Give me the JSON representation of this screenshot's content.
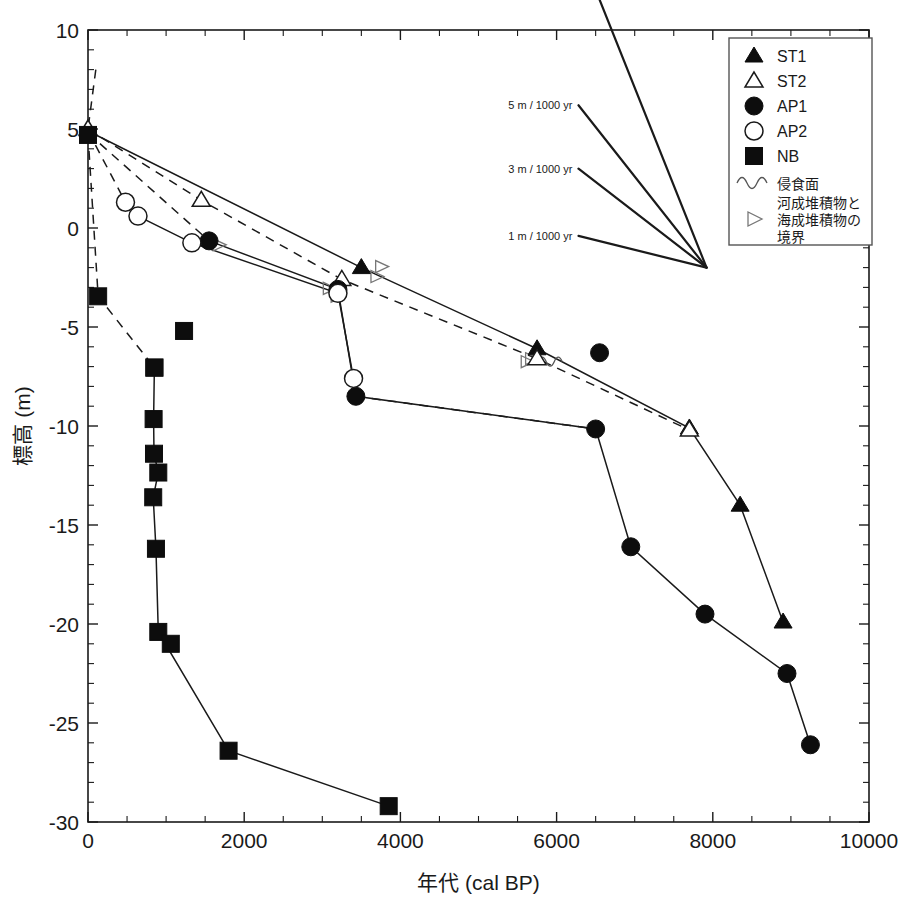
{
  "chart_data": {
    "type": "scatter",
    "title": "",
    "xlabel": "年代 (cal BP)",
    "ylabel": "標高 (m)",
    "xlim": [
      0,
      10000
    ],
    "ylim": [
      -30,
      10
    ],
    "xticks": [
      0,
      2000,
      4000,
      6000,
      8000,
      10000
    ],
    "xtick_labels": [
      "0",
      "2000",
      "4000",
      "6000",
      "8000",
      "10000"
    ],
    "x_minor_step": 500,
    "yticks": [
      10,
      5,
      0,
      -5,
      -10,
      -15,
      -20,
      -25,
      -30
    ],
    "ytick_labels": [
      "10",
      "5",
      "0",
      "-5",
      "-10",
      "-15",
      "-20",
      "-25",
      "-30"
    ],
    "y_minor_step": 1,
    "grid": false,
    "legend_position": "top-right",
    "series": [
      {
        "name": "ST1",
        "marker": "filled-triangle",
        "line": "solid",
        "points": [
          {
            "x": 0,
            "y": 4.9
          },
          {
            "x": 3500,
            "y": -2.0
          },
          {
            "x": 5750,
            "y": -6.1
          },
          {
            "x": 7700,
            "y": -10.1
          },
          {
            "x": 8350,
            "y": -14.0
          },
          {
            "x": 8900,
            "y": -19.9
          }
        ]
      },
      {
        "name": "ST2",
        "marker": "open-triangle",
        "line": "dashed",
        "points": [
          {
            "x": 0,
            "y": 5.0
          },
          {
            "x": 1450,
            "y": 1.4
          },
          {
            "x": 3250,
            "y": -2.6
          },
          {
            "x": 5750,
            "y": -6.6
          },
          {
            "x": 7700,
            "y": -10.2
          }
        ]
      },
      {
        "name": "AP1",
        "marker": "filled-circle",
        "line": "solid",
        "points": [
          {
            "x": 1550,
            "y": -0.65
          },
          {
            "x": 3200,
            "y": -3.1
          },
          {
            "x": 3430,
            "y": -8.5
          },
          {
            "x": 6500,
            "y": -10.15
          },
          {
            "x": 6950,
            "y": -16.1
          },
          {
            "x": 7900,
            "y": -19.5
          },
          {
            "x": 8950,
            "y": -22.5
          },
          {
            "x": 9250,
            "y": -26.1
          }
        ]
      },
      {
        "name": "AP1-outlier",
        "marker": "filled-circle",
        "line": "none",
        "points": [
          {
            "x": 6550,
            "y": -6.3
          }
        ]
      },
      {
        "name": "AP2",
        "marker": "open-circle",
        "line": "solid",
        "points": [
          {
            "x": 480,
            "y": 1.3
          },
          {
            "x": 640,
            "y": 0.6
          },
          {
            "x": 1330,
            "y": -0.75
          },
          {
            "x": 3200,
            "y": -3.3
          },
          {
            "x": 3400,
            "y": -7.6
          }
        ]
      },
      {
        "name": "AP2-dashed-upper",
        "marker": "none",
        "line": "dashed",
        "points": [
          {
            "x": 0,
            "y": 4.9
          },
          {
            "x": 480,
            "y": 1.3
          }
        ]
      },
      {
        "name": "AP1-dashed-upper",
        "marker": "none",
        "line": "dashed",
        "points": [
          {
            "x": 0,
            "y": 4.8
          },
          {
            "x": 1550,
            "y": -0.65
          }
        ]
      },
      {
        "name": "AP1-dashed-lower",
        "marker": "none",
        "line": "dashed",
        "points": [
          {
            "x": 3430,
            "y": -8.5
          },
          {
            "x": 6500,
            "y": -10.15
          }
        ]
      },
      {
        "name": "NB",
        "marker": "filled-square",
        "line": "solid",
        "points": [
          {
            "x": 850,
            "y": -7.05
          },
          {
            "x": 840,
            "y": -9.65
          },
          {
            "x": 845,
            "y": -11.4
          },
          {
            "x": 900,
            "y": -12.35
          },
          {
            "x": 835,
            "y": -13.6
          },
          {
            "x": 870,
            "y": -16.2
          },
          {
            "x": 900,
            "y": -20.4
          },
          {
            "x": 1800,
            "y": -26.4
          },
          {
            "x": 3850,
            "y": -29.2
          }
        ]
      },
      {
        "name": "NB-extra",
        "marker": "filled-square",
        "line": "none",
        "points": [
          {
            "x": 1230,
            "y": -5.2
          },
          {
            "x": 1060,
            "y": -21.0
          }
        ]
      },
      {
        "name": "NB-dashed",
        "marker": "filled-square",
        "line": "dashed",
        "points": [
          {
            "x": 0,
            "y": 4.7
          },
          {
            "x": 130,
            "y": -3.45
          },
          {
            "x": 850,
            "y": -7.05
          }
        ]
      },
      {
        "name": "upper-dashed-stub",
        "marker": "none",
        "line": "dashed",
        "points": [
          {
            "x": 100,
            "y": 8.0
          },
          {
            "x": 0,
            "y": 5.0
          }
        ]
      }
    ],
    "boundary_markers": [
      {
        "x": 1680,
        "y": -0.85
      },
      {
        "x": 3090,
        "y": -3.05
      },
      {
        "x": 3190,
        "y": -3.45
      },
      {
        "x": 3700,
        "y": -2.45
      },
      {
        "x": 3760,
        "y": -1.95
      },
      {
        "x": 5680,
        "y": -6.6
      }
    ],
    "erosion_markers": [
      {
        "x": 5880,
        "y": -6.75
      }
    ],
    "slope_fan": {
      "origin": {
        "x": 7920,
        "y": -2.0
      },
      "rays": [
        {
          "label": "10 m / 1000 yr",
          "tip": {
            "x": 6280,
            "y": 14.2
          }
        },
        {
          "label": "5 m / 1000 yr",
          "tip": {
            "x": 6280,
            "y": 6.2
          }
        },
        {
          "label": "3 m / 1000 yr",
          "tip": {
            "x": 6280,
            "y": 3.0
          }
        },
        {
          "label": "1 m / 1000 yr",
          "tip": {
            "x": 6280,
            "y": -0.4
          }
        }
      ]
    },
    "legend": {
      "entries": [
        {
          "label": "ST1",
          "marker": "filled-triangle"
        },
        {
          "label": "ST2",
          "marker": "open-triangle"
        },
        {
          "label": "AP1",
          "marker": "filled-circle"
        },
        {
          "label": "AP2",
          "marker": "open-circle"
        },
        {
          "label": "NB",
          "marker": "filled-square"
        },
        {
          "label": "侵食面",
          "marker": "squiggle"
        },
        {
          "label": "河成堆積物と\n海成堆積物の\n境界",
          "marker": "open-right-triangle"
        }
      ]
    },
    "colors": {
      "foreground": "#1a1a1a",
      "marker_fill": "#0d0d0d",
      "marker_open": "#ffffff",
      "background": "#ffffff"
    }
  }
}
